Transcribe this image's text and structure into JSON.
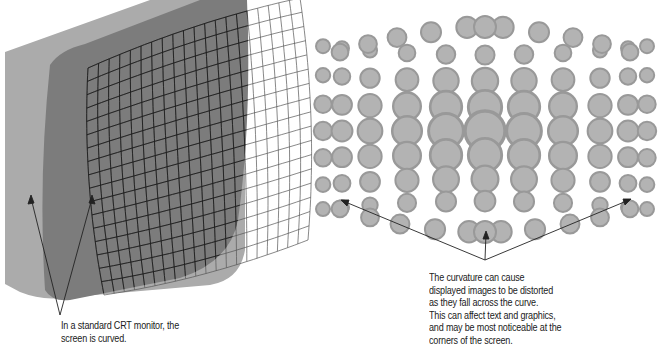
{
  "figure": {
    "left_panel": {
      "title": "CRT monitor with curved screen",
      "caption_lines": [
        "In a standard CRT monitor, the",
        "screen is curved."
      ],
      "colors": {
        "bezel": "#a8a8a8",
        "screen": "#7a7a7a",
        "grid_on_screen": "#222222",
        "grid_off_screen": "#555555"
      }
    },
    "right_panel": {
      "title": "Distortion of displayed image",
      "caption_lines": [
        "The curvature can cause",
        "displayed images to be distorted",
        "as they fall across the curve.",
        "This can affect text and graphics,",
        "and may be most noticeable at the",
        "corners of the screen."
      ],
      "colors": {
        "circle_fill": "#b3b3b3",
        "circle_stroke": "#999999"
      }
    }
  }
}
